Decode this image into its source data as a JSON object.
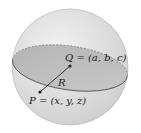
{
  "diagram": {
    "type": "sphere",
    "labels": {
      "center": "Q = (a, b, c)",
      "point": "P = (x, y, z)",
      "radius": "R"
    },
    "colors": {
      "sphere_fill": "#e4e4e4",
      "equator_fill": "#b8b8b8",
      "outline": "#555555",
      "text": "#222222"
    }
  }
}
